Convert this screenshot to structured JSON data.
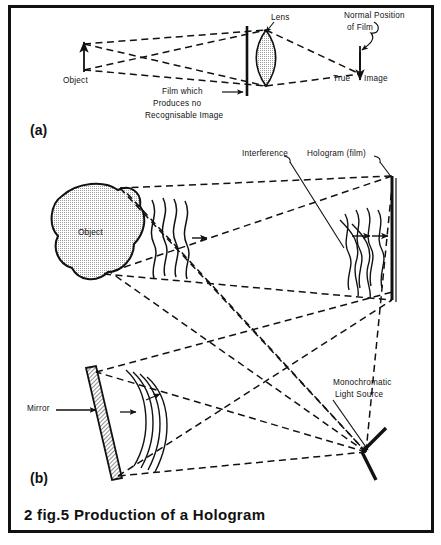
{
  "figure": {
    "caption": "2 fig.5  Production  of  a  Hologram",
    "part_a": {
      "tag": "(a)",
      "labels": {
        "object": "Object",
        "lens": "Lens",
        "film_line1": "Film  which",
        "film_line2": "Produces  no",
        "film_line3": "Recognisable  Image",
        "normal_line1": "Normal   Position",
        "normal_line2": "of   Film",
        "true": "True",
        "image": "Image"
      }
    },
    "part_b": {
      "tag": "(b)",
      "labels": {
        "object": "Object",
        "interference": "Interference",
        "hologram": "Hologram (film)",
        "mirror": "Mirror",
        "source_line1": "Monochromatic",
        "source_line2": "Light  Source"
      }
    },
    "colors": {
      "ink": "#111111",
      "paper": "#ffffff",
      "shade": "#c9c9c9",
      "lens_fill": "#b9b9b9"
    }
  }
}
